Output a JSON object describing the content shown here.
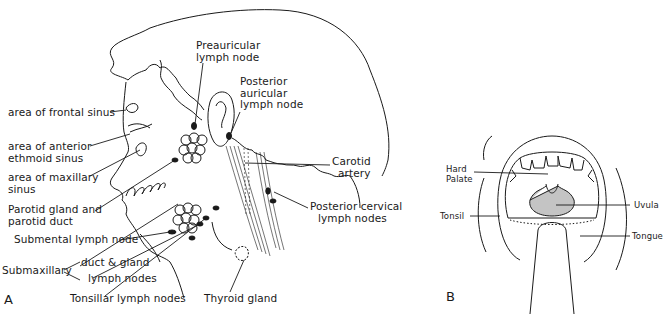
{
  "figure": {
    "panel_a": {
      "letter": "A",
      "labels": {
        "preauricular_1": "Preauricular",
        "preauricular_2": "lymph node",
        "posterior_auricular_1": "Posterior",
        "posterior_auricular_2": "auricular",
        "posterior_auricular_3": "lymph node",
        "frontal_sinus": "area of frontal sinus",
        "ethmoid_1": "area of anterior",
        "ethmoid_2": "ethmoid sinus",
        "maxillary_1": "area of maxillary",
        "maxillary_2": "sinus",
        "parotid_1": "Parotid gland and",
        "parotid_2": "parotid duct",
        "submental": "Submental lymph node",
        "submaxillary": "Submaxillary",
        "duct_gland": "duct & gland",
        "submax_nodes": "lymph nodes",
        "tonsillar": "Tonsillar lymph nodes",
        "thyroid": "Thyroid gland",
        "carotid_1": "Carotid",
        "carotid_2": "artery",
        "posterior_cervical_1": "Posterior cervical",
        "posterior_cervical_2": "lymph nodes"
      }
    },
    "panel_b": {
      "letter": "B",
      "labels": {
        "hard_palate_1": "Hard",
        "hard_palate_2": "Palate",
        "tonsil": "Tonsil",
        "uvula": "Uvula",
        "tongue": "Tongue"
      }
    }
  }
}
